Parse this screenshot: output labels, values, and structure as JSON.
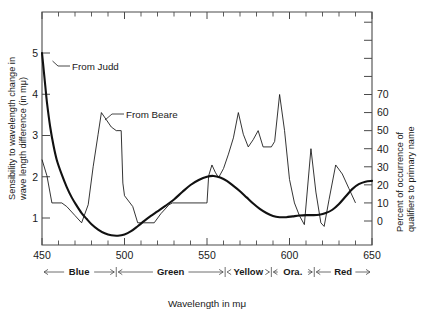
{
  "chart_data": {
    "type": "line",
    "title": "",
    "xlabel": "Wavelength in mμ",
    "xlim": [
      450,
      650
    ],
    "x_ticks": [
      450,
      500,
      550,
      600,
      650
    ],
    "x_minor_step": 10,
    "grid": false,
    "legend": "annotations",
    "y_left": {
      "label": "Sensibility to wavelength change in wave length difference (in mμ)",
      "ticks": [
        1,
        2,
        3,
        4,
        5
      ],
      "lim": [
        0.35,
        5.85
      ]
    },
    "y_right": {
      "label": "Percent of occurrence of qualifiers to primary name",
      "ticks": [
        0,
        10,
        20,
        30,
        40,
        50,
        60,
        70
      ],
      "lim": [
        -3,
        110
      ],
      "unlabeled_ticks_above_70": 4
    },
    "series": [
      {
        "name": "From Judd",
        "axis": "left",
        "style": "thick",
        "annotation": "From Judd",
        "points": [
          [
            450,
            5.0
          ],
          [
            451,
            4.6
          ],
          [
            452,
            4.2
          ],
          [
            453,
            3.8
          ],
          [
            455,
            3.2
          ],
          [
            457,
            2.75
          ],
          [
            459,
            2.4
          ],
          [
            462,
            2.05
          ],
          [
            465,
            1.75
          ],
          [
            468,
            1.5
          ],
          [
            471,
            1.3
          ],
          [
            474,
            1.12
          ],
          [
            477,
            0.98
          ],
          [
            480,
            0.85
          ],
          [
            484,
            0.72
          ],
          [
            488,
            0.63
          ],
          [
            492,
            0.58
          ],
          [
            496,
            0.57
          ],
          [
            500,
            0.6
          ],
          [
            504,
            0.68
          ],
          [
            508,
            0.8
          ],
          [
            512,
            0.93
          ],
          [
            516,
            1.05
          ],
          [
            520,
            1.16
          ],
          [
            525,
            1.3
          ],
          [
            530,
            1.45
          ],
          [
            535,
            1.63
          ],
          [
            540,
            1.8
          ],
          [
            545,
            1.92
          ],
          [
            550,
            2.0
          ],
          [
            554,
            2.02
          ],
          [
            558,
            1.98
          ],
          [
            562,
            1.9
          ],
          [
            566,
            1.78
          ],
          [
            570,
            1.65
          ],
          [
            574,
            1.5
          ],
          [
            578,
            1.35
          ],
          [
            582,
            1.22
          ],
          [
            586,
            1.12
          ],
          [
            590,
            1.05
          ],
          [
            594,
            1.02
          ],
          [
            598,
            1.02
          ],
          [
            602,
            1.04
          ],
          [
            606,
            1.06
          ],
          [
            610,
            1.07
          ],
          [
            614,
            1.07
          ],
          [
            618,
            1.08
          ],
          [
            622,
            1.12
          ],
          [
            626,
            1.2
          ],
          [
            630,
            1.34
          ],
          [
            634,
            1.52
          ],
          [
            638,
            1.7
          ],
          [
            642,
            1.82
          ],
          [
            646,
            1.88
          ],
          [
            650,
            1.9
          ]
        ]
      },
      {
        "name": "From Beare",
        "axis": "right",
        "style": "thin",
        "annotation": "From Beare",
        "points": [
          [
            450,
            34
          ],
          [
            453,
            25
          ],
          [
            456,
            10
          ],
          [
            462,
            10
          ],
          [
            465,
            8
          ],
          [
            470,
            3
          ],
          [
            474,
            -1
          ],
          [
            478,
            9
          ],
          [
            481,
            30
          ],
          [
            484,
            48
          ],
          [
            486,
            60
          ],
          [
            489,
            56
          ],
          [
            492,
            52
          ],
          [
            495,
            50
          ],
          [
            498,
            50
          ],
          [
            499,
            21
          ],
          [
            500,
            14
          ],
          [
            505,
            8
          ],
          [
            508,
            -1
          ],
          [
            518,
            -1
          ],
          [
            522,
            4
          ],
          [
            527,
            9
          ],
          [
            529,
            10
          ],
          [
            549,
            10
          ],
          [
            550,
            10
          ],
          [
            551,
            25
          ],
          [
            553,
            31
          ],
          [
            555,
            27
          ],
          [
            557,
            24
          ],
          [
            560,
            29
          ],
          [
            563,
            37
          ],
          [
            566,
            46
          ],
          [
            569,
            60
          ],
          [
            572,
            48
          ],
          [
            575,
            41
          ],
          [
            578,
            45
          ],
          [
            581,
            50
          ],
          [
            584,
            41
          ],
          [
            589,
            41
          ],
          [
            591,
            44
          ],
          [
            594,
            70
          ],
          [
            597,
            50
          ],
          [
            600,
            23
          ],
          [
            603,
            10
          ],
          [
            606,
            3
          ],
          [
            609,
            -2
          ],
          [
            613,
            40
          ],
          [
            616,
            16
          ],
          [
            619,
            -1
          ],
          [
            621,
            -3
          ],
          [
            624,
            12
          ],
          [
            628,
            31
          ],
          [
            632,
            26
          ],
          [
            636,
            18
          ],
          [
            640,
            10
          ]
        ]
      }
    ],
    "bands": [
      {
        "label": "Blue",
        "start": 450,
        "end": 495
      },
      {
        "label": "Green",
        "start": 495,
        "end": 561
      },
      {
        "label": "Yellow",
        "start": 561,
        "end": 589
      },
      {
        "label": "Ora.",
        "start": 589,
        "end": 615
      },
      {
        "label": "Red",
        "start": 615,
        "end": 650
      }
    ],
    "annotations": [
      {
        "text": "From Judd",
        "x": 468,
        "y_left": 4.45
      },
      {
        "text": "From Beare",
        "x": 505,
        "y_left": 3.55
      }
    ]
  },
  "axis": {
    "left_title_line1": "Sensibility to wavelength change in",
    "left_title_line2": "wave length difference (in mμ)",
    "right_title_line1": "Percent of occurrence of",
    "right_title_line2": "qualifiers to primary name",
    "x_title": "Wavelength in mμ"
  },
  "ticks": {
    "x": [
      "450",
      "500",
      "550",
      "600",
      "650"
    ],
    "y_left": [
      "1",
      "2",
      "3",
      "4",
      "5"
    ],
    "y_right": [
      "0",
      "10",
      "20",
      "30",
      "40",
      "50",
      "60",
      "70"
    ]
  },
  "bands": {
    "blue": "Blue",
    "green": "Green",
    "yellow": "Yellow",
    "orange": "Ora.",
    "red": "Red"
  },
  "annotations": {
    "judd": "From Judd",
    "beare": "From Beare"
  },
  "colors": {
    "background": "#ffffff",
    "ink": "#111111",
    "axis": "#4a4a4a"
  }
}
